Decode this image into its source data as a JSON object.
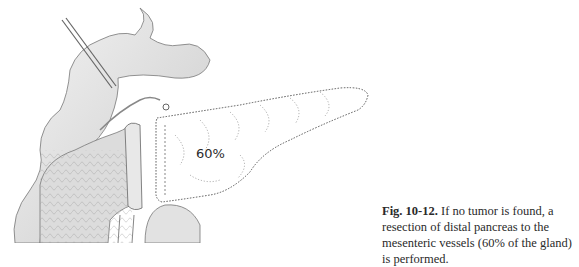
{
  "figure": {
    "number_label": "Fig. 10-12.",
    "caption_text": " If no tumor is found, a resection of distal pancreas to the mesenteric vessels (60% of the gland) is performed.",
    "illustration": {
      "subject": "pancreas-resection-anatomy",
      "region_label": "60%"
    }
  }
}
